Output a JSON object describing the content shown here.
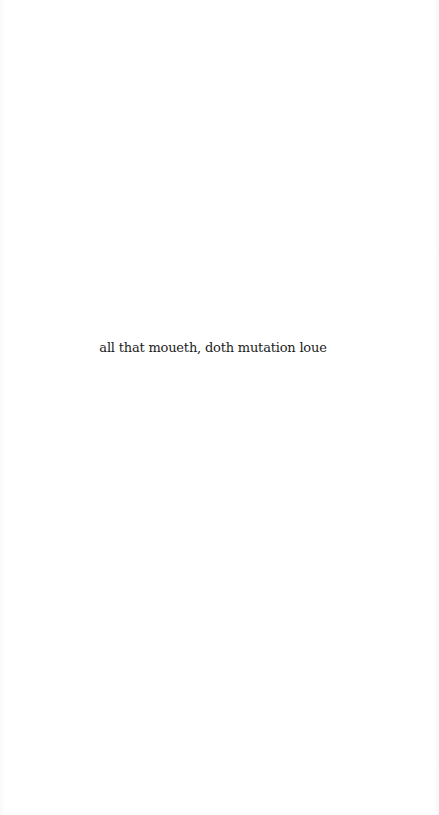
{
  "page": {
    "background_color": "#ffffff",
    "text_color": "#1c1c1c",
    "epigraph": "all that moueth, doth mutation loue"
  }
}
